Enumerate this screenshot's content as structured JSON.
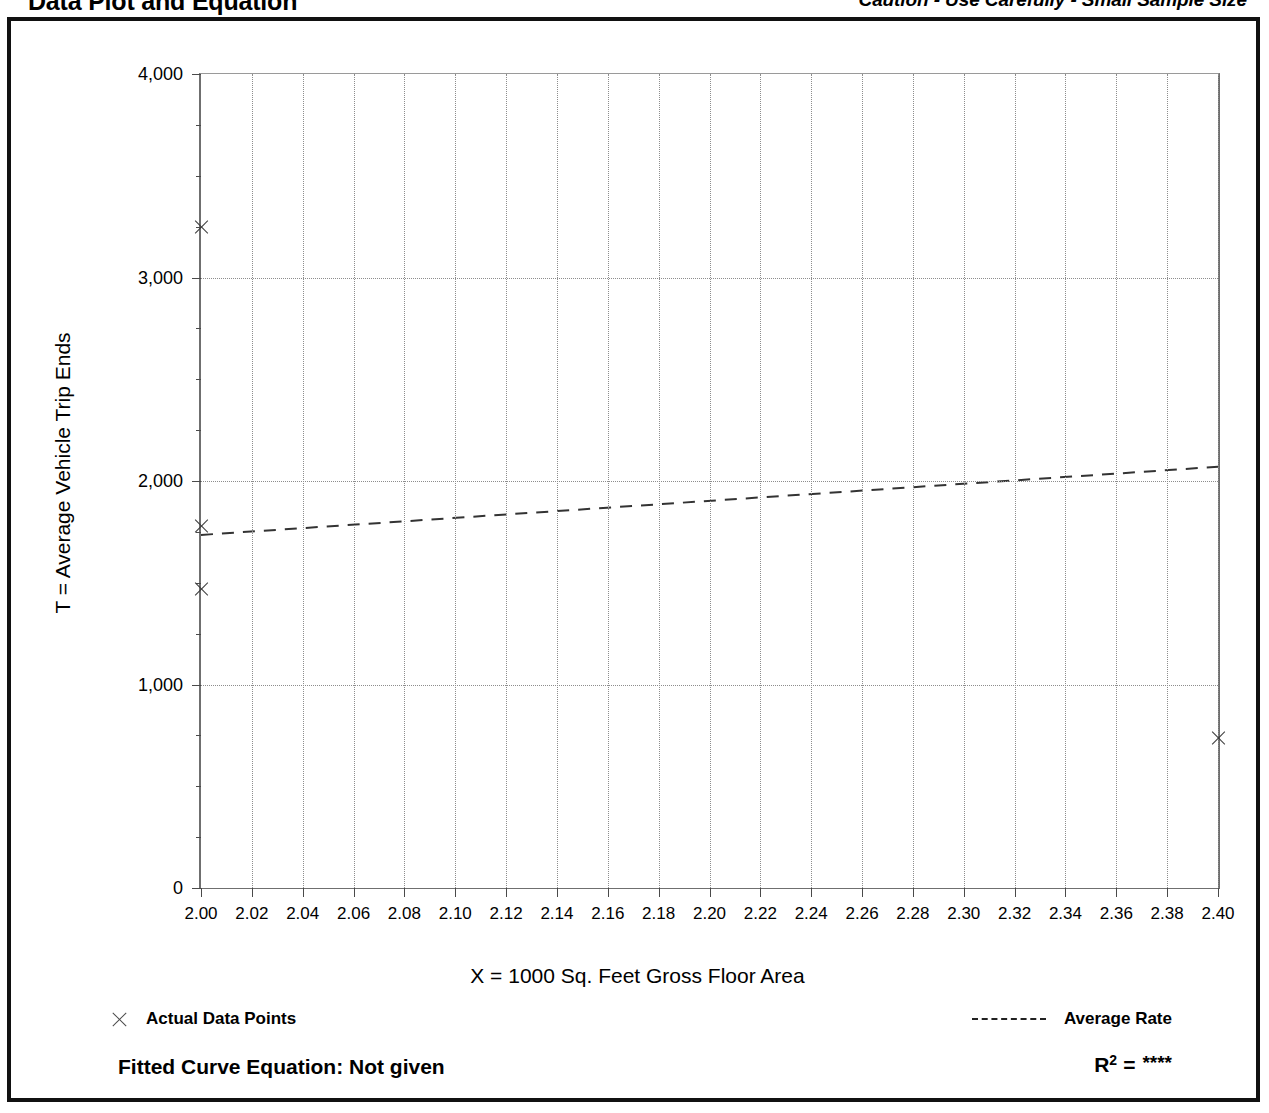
{
  "header": {
    "title": "Data Plot and Equation",
    "caution": "Caution - Use Carefully - Small Sample Size"
  },
  "axes": {
    "y_title": "T = Average Vehicle Trip Ends",
    "x_title": "X = 1000 Sq. Feet Gross Floor Area"
  },
  "legend": {
    "data_points_label": "Actual Data Points",
    "average_rate_label": "Average Rate",
    "data_points_marker": "x-marker-icon",
    "average_rate_marker": "dashed-line-icon"
  },
  "equation": {
    "fitted_label": "Fitted Curve Equation:  Not given",
    "r_symbol": "R",
    "r_exponent": "2",
    "equals": "=",
    "r_value": "****"
  },
  "chart_data": {
    "type": "scatter",
    "title": "Data Plot and Equation",
    "xlabel": "X = 1000 Sq. Feet Gross Floor Area",
    "ylabel": "T = Average Vehicle Trip Ends",
    "xlim": [
      2.0,
      2.4
    ],
    "ylim": [
      0,
      4000
    ],
    "grid": true,
    "legend_position": "below-plot",
    "x_ticks": [
      "2.00",
      "2.02",
      "2.04",
      "2.06",
      "2.08",
      "2.10",
      "2.12",
      "2.14",
      "2.16",
      "2.18",
      "2.20",
      "2.22",
      "2.24",
      "2.26",
      "2.28",
      "2.30",
      "2.32",
      "2.34",
      "2.36",
      "2.38",
      "2.40"
    ],
    "x_tick_values": [
      2.0,
      2.02,
      2.04,
      2.06,
      2.08,
      2.1,
      2.12,
      2.14,
      2.16,
      2.18,
      2.2,
      2.22,
      2.24,
      2.26,
      2.28,
      2.3,
      2.32,
      2.34,
      2.36,
      2.38,
      2.4
    ],
    "y_ticks": [
      "0",
      "1,000",
      "2,000",
      "3,000",
      "4,000"
    ],
    "y_tick_values": [
      0,
      1000,
      2000,
      3000,
      4000
    ],
    "y_minor_ticks": [
      250,
      500,
      750,
      1250,
      1500,
      1750,
      2250,
      2500,
      2750,
      3250,
      3500,
      3750
    ],
    "y_gridlines": [
      1000,
      2000,
      3000
    ],
    "series": [
      {
        "name": "Actual Data Points",
        "type": "scatter",
        "marker": "x",
        "points": [
          {
            "x": 2.0,
            "y": 3250
          },
          {
            "x": 2.0,
            "y": 1780
          },
          {
            "x": 2.0,
            "y": 1470
          },
          {
            "x": 2.4,
            "y": 735
          }
        ]
      },
      {
        "name": "Average Rate",
        "type": "line",
        "style": "dashed",
        "points": [
          {
            "x": 2.0,
            "y": 1735
          },
          {
            "x": 2.4,
            "y": 2070
          }
        ]
      }
    ]
  }
}
